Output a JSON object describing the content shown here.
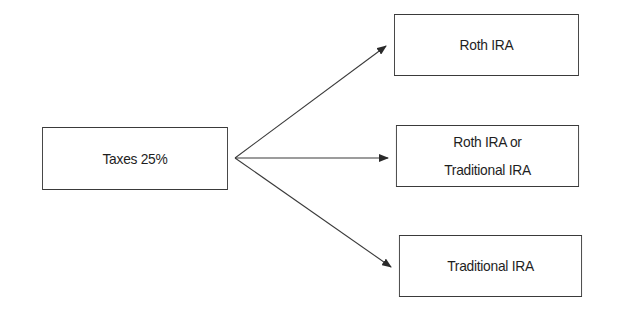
{
  "diagram": {
    "source": {
      "label": "Taxes 25%"
    },
    "targets": [
      {
        "lines": [
          "Roth IRA"
        ]
      },
      {
        "lines": [
          "Roth IRA or",
          "Traditional IRA"
        ]
      },
      {
        "lines": [
          "Traditional IRA"
        ]
      }
    ],
    "colors": {
      "stroke": "#3a3a3a",
      "text": "#1e1e1e",
      "background": "#ffffff"
    }
  }
}
